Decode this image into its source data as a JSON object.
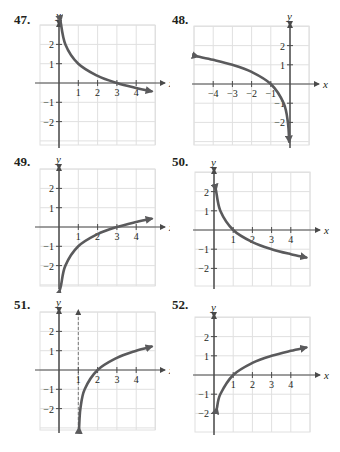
{
  "colors": {
    "curve": "#5a5a5c",
    "axis": "#4a4a4a",
    "grid": "#e0e0e0",
    "text": "#231f20"
  },
  "chart_data": [
    {
      "type": "line",
      "label": "47.",
      "title": "",
      "xlabel": "x",
      "ylabel": "y",
      "xlim": [
        -1,
        5
      ],
      "ylim": [
        -3,
        3
      ],
      "grid": true,
      "xticks": [
        "1",
        "2",
        "3",
        "4"
      ],
      "yticks": [
        "2",
        "1",
        "−1",
        "−2"
      ],
      "function": "y = 1 - log3(x)",
      "points": [
        [
          0.08,
          3.3
        ],
        [
          0.33,
          2
        ],
        [
          1,
          1
        ],
        [
          2,
          0.37
        ],
        [
          3,
          0
        ],
        [
          4,
          -0.26
        ],
        [
          4.8,
          -0.43
        ]
      ],
      "asymptote": null
    },
    {
      "type": "line",
      "label": "48.",
      "title": "",
      "xlabel": "x",
      "ylabel": "y",
      "xlim": [
        -5,
        1
      ],
      "ylim": [
        -3,
        3
      ],
      "grid": true,
      "xticks": [
        "−4",
        "−3",
        "−2",
        "−1"
      ],
      "yticks": [
        "2",
        "1",
        "−1",
        "−2"
      ],
      "function": "y = log3(-x)",
      "points": [
        [
          -4.8,
          1.43
        ],
        [
          -4,
          1.26
        ],
        [
          -3,
          1
        ],
        [
          -2,
          0.63
        ],
        [
          -1,
          0
        ],
        [
          -0.33,
          -1
        ],
        [
          -0.11,
          -2
        ],
        [
          -0.04,
          -3
        ]
      ],
      "asymptote": null
    },
    {
      "type": "line",
      "label": "49.",
      "title": "",
      "xlabel": "x",
      "ylabel": "y",
      "xlim": [
        -1,
        5
      ],
      "ylim": [
        -3,
        3
      ],
      "grid": true,
      "xticks": [
        "1",
        "2",
        "3",
        "4"
      ],
      "yticks": [
        "2",
        "1",
        "−1",
        "−2"
      ],
      "function": "y = log3(x) - 1",
      "points": [
        [
          0.04,
          -3.9
        ],
        [
          0.11,
          -3
        ],
        [
          0.33,
          -2
        ],
        [
          1,
          -1
        ],
        [
          2,
          -0.37
        ],
        [
          3,
          0
        ],
        [
          4,
          0.26
        ],
        [
          4.8,
          0.43
        ]
      ],
      "asymptote": null
    },
    {
      "type": "line",
      "label": "50.",
      "title": "",
      "xlabel": "x",
      "ylabel": "y",
      "xlim": [
        -1,
        5
      ],
      "ylim": [
        -3,
        3
      ],
      "grid": true,
      "xticks": [
        "1",
        "2",
        "3",
        "4"
      ],
      "yticks": [
        "2",
        "1",
        "−1",
        "−2"
      ],
      "function": "y = -log3(x)",
      "points": [
        [
          0.1,
          2.1
        ],
        [
          0.33,
          1
        ],
        [
          1,
          0
        ],
        [
          2,
          -0.63
        ],
        [
          3,
          -1
        ],
        [
          4,
          -1.26
        ],
        [
          4.8,
          -1.43
        ]
      ],
      "asymptote": null
    },
    {
      "type": "line",
      "label": "51.",
      "title": "",
      "xlabel": "x",
      "ylabel": "y",
      "xlim": [
        -1,
        5
      ],
      "ylim": [
        -3,
        3
      ],
      "grid": true,
      "xticks": [
        "1",
        "2",
        "3",
        "4"
      ],
      "yticks": [
        "2",
        "1",
        "−1",
        "−2"
      ],
      "function": "y = log3(x - 1)",
      "points": [
        [
          1.04,
          -3
        ],
        [
          1.11,
          -2
        ],
        [
          1.33,
          -1
        ],
        [
          2,
          0
        ],
        [
          3,
          0.63
        ],
        [
          4,
          1
        ],
        [
          4.8,
          1.21
        ]
      ],
      "asymptote": {
        "x": 1,
        "style": "dashed"
      }
    },
    {
      "type": "line",
      "label": "52.",
      "title": "",
      "xlabel": "x",
      "ylabel": "y",
      "xlim": [
        -1,
        5
      ],
      "ylim": [
        -3,
        3
      ],
      "grid": true,
      "xticks": [
        "1",
        "2",
        "3",
        "4"
      ],
      "yticks": [
        "2",
        "1",
        "−1",
        "−2"
      ],
      "function": "y = log3(x)",
      "points": [
        [
          0.15,
          -1.73
        ],
        [
          0.33,
          -1
        ],
        [
          1,
          0
        ],
        [
          2,
          0.63
        ],
        [
          3,
          1
        ],
        [
          4,
          1.26
        ],
        [
          4.8,
          1.43
        ]
      ],
      "asymptote": null
    }
  ],
  "panels": [
    {
      "label": "47.",
      "x_axis": "x",
      "y_axis": "y"
    },
    {
      "label": "48.",
      "x_axis": "x",
      "y_axis": "y"
    },
    {
      "label": "49.",
      "x_axis": "x",
      "y_axis": "y"
    },
    {
      "label": "50.",
      "x_axis": "x",
      "y_axis": "y"
    },
    {
      "label": "51.",
      "x_axis": "x",
      "y_axis": "y"
    },
    {
      "label": "52.",
      "x_axis": "x",
      "y_axis": "y"
    }
  ]
}
